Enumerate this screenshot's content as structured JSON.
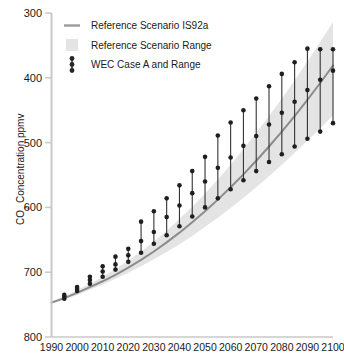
{
  "chart_data": {
    "type": "line",
    "title": "",
    "xlabel": "",
    "ylabel": "CO₂ Concentration ppmv",
    "ylabel_main": "CO",
    "ylabel_sub": "2",
    "ylabel_rest": " Concentration ppmv",
    "xlim": [
      1990,
      2100
    ],
    "ylim": [
      300,
      800
    ],
    "grid": false,
    "legend_position": "top-left",
    "x_ticks": [
      1990,
      2000,
      2010,
      2020,
      2030,
      2040,
      2050,
      2060,
      2070,
      2080,
      2090,
      2100
    ],
    "y_ticks": [
      300,
      400,
      500,
      600,
      700,
      800
    ],
    "legend": [
      {
        "label": "Reference Scenario IS92a",
        "marker": "line",
        "color": "#8c8c8c"
      },
      {
        "label": "Reference Scenario Range",
        "marker": "band",
        "color": "#e2e2e2"
      },
      {
        "label": "WEC Case A and Range",
        "marker": "errorbar",
        "color": "#262626"
      }
    ],
    "series": [
      {
        "name": "Reference Scenario IS92a",
        "type": "line",
        "color": "#8c8c8c",
        "x": [
          1990,
          1995,
          2000,
          2005,
          2010,
          2015,
          2020,
          2025,
          2030,
          2035,
          2040,
          2045,
          2050,
          2055,
          2060,
          2065,
          2070,
          2075,
          2080,
          2085,
          2090,
          2095,
          2100
        ],
        "values": [
          353,
          360,
          368,
          377,
          386,
          396,
          407,
          419,
          432,
          446,
          461,
          477,
          494,
          512,
          531,
          551,
          572,
          594,
          617,
          641,
          666,
          692,
          719
        ]
      },
      {
        "name": "Reference Scenario Range",
        "type": "band",
        "color": "#e2e2e2",
        "x": [
          1990,
          1995,
          2000,
          2005,
          2010,
          2015,
          2020,
          2025,
          2030,
          2035,
          2040,
          2045,
          2050,
          2055,
          2060,
          2065,
          2070,
          2075,
          2080,
          2085,
          2090,
          2095,
          2100
        ],
        "upper": [
          355,
          363,
          372,
          382,
          393,
          405,
          418,
          432,
          447,
          464,
          482,
          501,
          521,
          543,
          566,
          590,
          615,
          641,
          668,
          696,
          725,
          755,
          786
        ],
        "lower": [
          351,
          358,
          365,
          373,
          381,
          390,
          399,
          409,
          420,
          431,
          443,
          456,
          470,
          484,
          499,
          515,
          531,
          548,
          566,
          584,
          603,
          622,
          642
        ]
      },
      {
        "name": "WEC Case A and Range",
        "type": "errorbar",
        "color": "#262626",
        "x": [
          1995,
          2000,
          2005,
          2010,
          2015,
          2020,
          2025,
          2030,
          2035,
          2040,
          2045,
          2050,
          2055,
          2060,
          2065,
          2070,
          2075,
          2080,
          2085,
          2090,
          2095,
          2100
        ],
        "high": [
          364,
          376,
          392,
          408,
          423,
          435,
          477,
          492,
          513,
          533,
          555,
          577,
          610,
          630,
          649,
          667,
          686,
          705,
          723,
          744,
          744,
          744
        ],
        "mid": [
          362,
          374,
          388,
          401,
          412,
          426,
          440,
          455,
          470,
          485,
          500,
          516,
          533,
          551,
          570,
          590,
          611,
          632,
          654,
          677,
          700,
          711
        ],
        "low": [
          360,
          371,
          382,
          393,
          404,
          415,
          428,
          441,
          455,
          470,
          485,
          500,
          515,
          530,
          545,
          561,
          578,
          595,
          613,
          631,
          650,
          630
        ]
      }
    ],
    "wec_bars": [
      {
        "year": 1995,
        "top": 365,
        "mid": 362,
        "bottom": 359
      },
      {
        "year": 2000,
        "top": 377,
        "mid": 374,
        "bottom": 371
      },
      {
        "year": 2005,
        "top": 393,
        "mid": 388,
        "bottom": 382
      },
      {
        "year": 2010,
        "top": 409,
        "mid": 401,
        "bottom": 393
      },
      {
        "year": 2015,
        "top": 424,
        "mid": 412,
        "bottom": 404
      },
      {
        "year": 2020,
        "top": 436,
        "mid": 426,
        "bottom": 416
      },
      {
        "year": 2025,
        "top": 478,
        "mid": 448,
        "bottom": 430
      },
      {
        "year": 2030,
        "top": 494,
        "mid": 462,
        "bottom": 444
      },
      {
        "year": 2035,
        "top": 514,
        "mid": 485,
        "bottom": 457
      },
      {
        "year": 2040,
        "top": 534,
        "mid": 503,
        "bottom": 471
      },
      {
        "year": 2045,
        "top": 556,
        "mid": 522,
        "bottom": 486
      },
      {
        "year": 2050,
        "top": 578,
        "mid": 540,
        "bottom": 500
      },
      {
        "year": 2055,
        "top": 611,
        "mid": 561,
        "bottom": 514
      },
      {
        "year": 2060,
        "top": 631,
        "mid": 577,
        "bottom": 528
      },
      {
        "year": 2065,
        "top": 650,
        "mid": 595,
        "bottom": 542
      },
      {
        "year": 2070,
        "top": 668,
        "mid": 610,
        "bottom": 556
      },
      {
        "year": 2075,
        "top": 687,
        "mid": 628,
        "bottom": 570
      },
      {
        "year": 2080,
        "top": 706,
        "mid": 646,
        "bottom": 582
      },
      {
        "year": 2085,
        "top": 724,
        "mid": 663,
        "bottom": 594
      },
      {
        "year": 2090,
        "top": 745,
        "mid": 681,
        "bottom": 606
      },
      {
        "year": 2095,
        "top": 744,
        "mid": 697,
        "bottom": 617
      },
      {
        "year": 2100,
        "top": 744,
        "mid": 711,
        "bottom": 630
      }
    ]
  },
  "axes": {
    "y_axis_title": "CO2 Concentration ppmv",
    "y_tick_labels": [
      "800",
      "700",
      "600",
      "500",
      "400",
      "300"
    ],
    "x_tick_labels": [
      "1990",
      "2000",
      "2010",
      "2020",
      "2030",
      "2040",
      "2050",
      "2060",
      "2070",
      "2080",
      "2090",
      "2100"
    ]
  },
  "legend_items": [
    {
      "label": "Reference Scenario IS92a"
    },
    {
      "label": "Reference Scenario Range"
    },
    {
      "label": "WEC Case A and Range"
    }
  ],
  "colors": {
    "line": "#8c8c8c",
    "band": "#e4e4e4",
    "marker": "#262626",
    "axis": "#c9c9c9",
    "text": "#1a1a1a",
    "background": "#ffffff"
  }
}
